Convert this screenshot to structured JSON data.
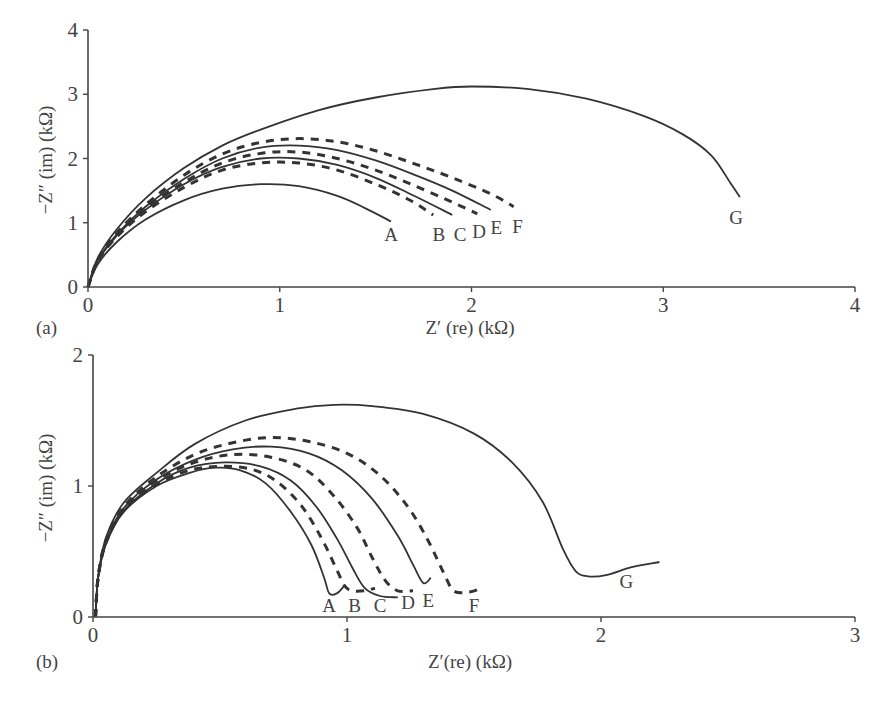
{
  "figure": {
    "panels": [
      "(a)",
      "(b)"
    ]
  },
  "chart_data": [
    {
      "type": "line",
      "panel": "(a)",
      "title": "",
      "xlabel": "Z′ (re) (kΩ)",
      "ylabel": "−Z″ (im) (kΩ)",
      "xlim": [
        0,
        4
      ],
      "ylim": [
        0,
        4
      ],
      "xticks": [
        "0",
        "1",
        "2",
        "3",
        "4"
      ],
      "yticks": [
        "0",
        "1",
        "2",
        "3",
        "4"
      ],
      "grid": false,
      "legend": "inline labels at curve ends",
      "series": [
        {
          "name": "A",
          "style": "solid",
          "label_pos": [
            1.58,
            0.72
          ],
          "points": [
            [
              0,
              0
            ],
            [
              0.05,
              0.35
            ],
            [
              0.15,
              0.7
            ],
            [
              0.3,
              1.05
            ],
            [
              0.5,
              1.35
            ],
            [
              0.7,
              1.53
            ],
            [
              0.9,
              1.6
            ],
            [
              1.1,
              1.57
            ],
            [
              1.3,
              1.42
            ],
            [
              1.45,
              1.22
            ],
            [
              1.58,
              1.02
            ]
          ]
        },
        {
          "name": "B",
          "style": "dashed",
          "label_pos": [
            1.83,
            0.72
          ],
          "points": [
            [
              0,
              0
            ],
            [
              0.05,
              0.4
            ],
            [
              0.15,
              0.78
            ],
            [
              0.3,
              1.17
            ],
            [
              0.5,
              1.55
            ],
            [
              0.7,
              1.82
            ],
            [
              0.9,
              1.93
            ],
            [
              1.1,
              1.93
            ],
            [
              1.3,
              1.82
            ],
            [
              1.5,
              1.6
            ],
            [
              1.68,
              1.35
            ],
            [
              1.8,
              1.12
            ]
          ]
        },
        {
          "name": "C",
          "style": "solid",
          "label_pos": [
            1.94,
            0.72
          ],
          "points": [
            [
              0,
              0
            ],
            [
              0.05,
              0.4
            ],
            [
              0.15,
              0.8
            ],
            [
              0.3,
              1.2
            ],
            [
              0.5,
              1.6
            ],
            [
              0.7,
              1.87
            ],
            [
              0.9,
              2.0
            ],
            [
              1.1,
              2.0
            ],
            [
              1.3,
              1.9
            ],
            [
              1.5,
              1.7
            ],
            [
              1.7,
              1.42
            ],
            [
              1.9,
              1.12
            ]
          ]
        },
        {
          "name": "D",
          "style": "dashed",
          "label_pos": [
            2.04,
            0.76
          ],
          "points": [
            [
              0,
              0
            ],
            [
              0.05,
              0.4
            ],
            [
              0.15,
              0.8
            ],
            [
              0.3,
              1.22
            ],
            [
              0.5,
              1.63
            ],
            [
              0.7,
              1.93
            ],
            [
              0.9,
              2.08
            ],
            [
              1.1,
              2.1
            ],
            [
              1.3,
              2.0
            ],
            [
              1.5,
              1.82
            ],
            [
              1.7,
              1.58
            ],
            [
              1.9,
              1.32
            ],
            [
              2.03,
              1.14
            ]
          ]
        },
        {
          "name": "E",
          "style": "solid",
          "label_pos": [
            2.13,
            0.82
          ],
          "points": [
            [
              0,
              0
            ],
            [
              0.05,
              0.41
            ],
            [
              0.15,
              0.82
            ],
            [
              0.3,
              1.25
            ],
            [
              0.5,
              1.68
            ],
            [
              0.7,
              2.0
            ],
            [
              0.9,
              2.17
            ],
            [
              1.1,
              2.2
            ],
            [
              1.3,
              2.13
            ],
            [
              1.5,
              1.97
            ],
            [
              1.7,
              1.75
            ],
            [
              1.9,
              1.5
            ],
            [
              2.1,
              1.2
            ]
          ]
        },
        {
          "name": "F",
          "style": "dashed",
          "label_pos": [
            2.24,
            0.84
          ],
          "points": [
            [
              0,
              0
            ],
            [
              0.05,
              0.42
            ],
            [
              0.15,
              0.84
            ],
            [
              0.3,
              1.28
            ],
            [
              0.5,
              1.74
            ],
            [
              0.7,
              2.07
            ],
            [
              0.9,
              2.25
            ],
            [
              1.1,
              2.31
            ],
            [
              1.3,
              2.26
            ],
            [
              1.5,
              2.12
            ],
            [
              1.7,
              1.92
            ],
            [
              1.9,
              1.7
            ],
            [
              2.1,
              1.45
            ],
            [
              2.22,
              1.25
            ]
          ]
        },
        {
          "name": "G",
          "style": "solid",
          "label_pos": [
            3.38,
            0.98
          ],
          "points": [
            [
              0,
              0
            ],
            [
              0.05,
              0.45
            ],
            [
              0.15,
              0.9
            ],
            [
              0.3,
              1.38
            ],
            [
              0.5,
              1.85
            ],
            [
              0.7,
              2.2
            ],
            [
              0.9,
              2.45
            ],
            [
              1.2,
              2.75
            ],
            [
              1.5,
              2.95
            ],
            [
              1.8,
              3.08
            ],
            [
              2.0,
              3.12
            ],
            [
              2.3,
              3.08
            ],
            [
              2.6,
              2.93
            ],
            [
              2.9,
              2.66
            ],
            [
              3.1,
              2.38
            ],
            [
              3.25,
              2.05
            ],
            [
              3.35,
              1.62
            ],
            [
              3.4,
              1.4
            ]
          ]
        }
      ]
    },
    {
      "type": "line",
      "panel": "(b)",
      "title": "",
      "xlabel": "Z′(re) (kΩ)",
      "ylabel": "−Z″ (im) (kΩ)",
      "xlim": [
        0,
        3
      ],
      "ylim": [
        0,
        2
      ],
      "xticks": [
        "0",
        "1",
        "2",
        "3"
      ],
      "yticks": [
        "0",
        "1",
        "2"
      ],
      "grid": false,
      "legend": "inline labels at curve ends",
      "series": [
        {
          "name": "A",
          "style": "solid",
          "label_pos": [
            0.93,
            0.04
          ],
          "points": [
            [
              0.01,
              0
            ],
            [
              0.02,
              0.3
            ],
            [
              0.05,
              0.55
            ],
            [
              0.12,
              0.8
            ],
            [
              0.25,
              1.0
            ],
            [
              0.38,
              1.1
            ],
            [
              0.48,
              1.14
            ],
            [
              0.58,
              1.12
            ],
            [
              0.68,
              1.02
            ],
            [
              0.78,
              0.8
            ],
            [
              0.86,
              0.55
            ],
            [
              0.91,
              0.3
            ],
            [
              0.93,
              0.18
            ],
            [
              0.96,
              0.18
            ],
            [
              0.99,
              0.24
            ]
          ]
        },
        {
          "name": "B",
          "style": "dashed",
          "label_pos": [
            1.03,
            0.04
          ],
          "points": [
            [
              0.01,
              0
            ],
            [
              0.02,
              0.3
            ],
            [
              0.05,
              0.56
            ],
            [
              0.12,
              0.81
            ],
            [
              0.25,
              1.01
            ],
            [
              0.38,
              1.12
            ],
            [
              0.5,
              1.15
            ],
            [
              0.62,
              1.13
            ],
            [
              0.72,
              1.04
            ],
            [
              0.82,
              0.85
            ],
            [
              0.9,
              0.6
            ],
            [
              0.96,
              0.36
            ],
            [
              0.99,
              0.24
            ],
            [
              1.02,
              0.2
            ],
            [
              1.07,
              0.2
            ],
            [
              1.11,
              0.22
            ]
          ]
        },
        {
          "name": "C",
          "style": "solid",
          "label_pos": [
            1.13,
            0.04
          ],
          "points": [
            [
              0.01,
              0
            ],
            [
              0.02,
              0.3
            ],
            [
              0.05,
              0.56
            ],
            [
              0.12,
              0.81
            ],
            [
              0.25,
              1.02
            ],
            [
              0.38,
              1.14
            ],
            [
              0.52,
              1.18
            ],
            [
              0.66,
              1.15
            ],
            [
              0.78,
              1.04
            ],
            [
              0.88,
              0.84
            ],
            [
              0.96,
              0.6
            ],
            [
              1.02,
              0.38
            ],
            [
              1.07,
              0.22
            ],
            [
              1.13,
              0.16
            ],
            [
              1.2,
              0.15
            ]
          ]
        },
        {
          "name": "D",
          "style": "dashed",
          "label_pos": [
            1.24,
            0.06
          ],
          "points": [
            [
              0.01,
              0
            ],
            [
              0.02,
              0.3
            ],
            [
              0.05,
              0.57
            ],
            [
              0.12,
              0.82
            ],
            [
              0.25,
              1.04
            ],
            [
              0.4,
              1.18
            ],
            [
              0.55,
              1.24
            ],
            [
              0.7,
              1.22
            ],
            [
              0.84,
              1.12
            ],
            [
              0.95,
              0.92
            ],
            [
              1.04,
              0.68
            ],
            [
              1.1,
              0.45
            ],
            [
              1.15,
              0.28
            ],
            [
              1.2,
              0.2
            ],
            [
              1.26,
              0.2
            ]
          ]
        },
        {
          "name": "E",
          "style": "solid",
          "label_pos": [
            1.32,
            0.08
          ],
          "points": [
            [
              0.01,
              0
            ],
            [
              0.02,
              0.3
            ],
            [
              0.05,
              0.57
            ],
            [
              0.12,
              0.83
            ],
            [
              0.25,
              1.05
            ],
            [
              0.4,
              1.2
            ],
            [
              0.55,
              1.28
            ],
            [
              0.7,
              1.3
            ],
            [
              0.85,
              1.25
            ],
            [
              0.98,
              1.12
            ],
            [
              1.1,
              0.9
            ],
            [
              1.2,
              0.62
            ],
            [
              1.26,
              0.4
            ],
            [
              1.3,
              0.26
            ],
            [
              1.33,
              0.3
            ]
          ]
        },
        {
          "name": "F",
          "style": "dashed",
          "label_pos": [
            1.5,
            0.04
          ],
          "points": [
            [
              0.01,
              0
            ],
            [
              0.02,
              0.3
            ],
            [
              0.05,
              0.58
            ],
            [
              0.12,
              0.84
            ],
            [
              0.25,
              1.07
            ],
            [
              0.4,
              1.24
            ],
            [
              0.55,
              1.33
            ],
            [
              0.7,
              1.37
            ],
            [
              0.85,
              1.34
            ],
            [
              1.0,
              1.25
            ],
            [
              1.13,
              1.08
            ],
            [
              1.24,
              0.84
            ],
            [
              1.32,
              0.58
            ],
            [
              1.38,
              0.34
            ],
            [
              1.42,
              0.2
            ],
            [
              1.48,
              0.19
            ],
            [
              1.53,
              0.22
            ]
          ]
        },
        {
          "name": "G",
          "style": "solid",
          "label_pos": [
            2.1,
            0.22
          ],
          "points": [
            [
              0.01,
              0
            ],
            [
              0.02,
              0.3
            ],
            [
              0.05,
              0.6
            ],
            [
              0.12,
              0.87
            ],
            [
              0.25,
              1.1
            ],
            [
              0.4,
              1.32
            ],
            [
              0.6,
              1.5
            ],
            [
              0.8,
              1.59
            ],
            [
              0.95,
              1.62
            ],
            [
              1.1,
              1.61
            ],
            [
              1.3,
              1.55
            ],
            [
              1.5,
              1.4
            ],
            [
              1.65,
              1.18
            ],
            [
              1.77,
              0.88
            ],
            [
              1.85,
              0.52
            ],
            [
              1.9,
              0.35
            ],
            [
              1.95,
              0.31
            ],
            [
              2.02,
              0.32
            ],
            [
              2.12,
              0.38
            ],
            [
              2.23,
              0.42
            ]
          ]
        }
      ]
    }
  ]
}
